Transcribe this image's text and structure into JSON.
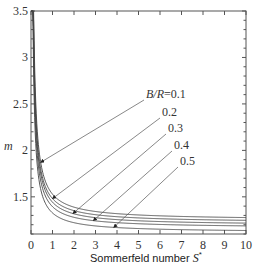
{
  "chart_data": {
    "type": "line",
    "title": "",
    "xlabel": "Sommerfeld number S*",
    "ylabel": "m",
    "xlim": [
      0,
      10
    ],
    "ylim": [
      1.1,
      3.5
    ],
    "xticks": [
      "0",
      "1",
      "2",
      "3",
      "4",
      "5",
      "6",
      "7",
      "8",
      "9",
      "10"
    ],
    "yticks": [
      "1.5",
      "2",
      "2.5",
      "3",
      "3.5"
    ],
    "grid": false,
    "legend_position": "inline annotations with arrows",
    "annotation_prefix": "B/R=",
    "x": [
      0.05,
      0.1,
      0.2,
      0.3,
      0.5,
      0.75,
      1,
      1.5,
      2,
      3,
      4,
      5,
      6,
      7,
      8,
      9,
      10
    ],
    "series": [
      {
        "name": "B/R=0.1",
        "label": "B/R=0.1",
        "values": [
          3.5,
          2.9,
          2.3,
          2.0,
          1.75,
          1.62,
          1.56,
          1.49,
          1.45,
          1.41,
          1.38,
          1.36,
          1.34,
          1.32,
          1.31,
          1.3,
          1.28
        ]
      },
      {
        "name": "B/R=0.2",
        "label": "0.2",
        "values": [
          3.4,
          2.75,
          2.18,
          1.92,
          1.68,
          1.57,
          1.51,
          1.45,
          1.42,
          1.38,
          1.35,
          1.33,
          1.31,
          1.29,
          1.28,
          1.27,
          1.25
        ]
      },
      {
        "name": "B/R=0.3",
        "label": "0.3",
        "values": [
          3.3,
          2.6,
          2.07,
          1.84,
          1.62,
          1.52,
          1.47,
          1.41,
          1.38,
          1.34,
          1.32,
          1.3,
          1.28,
          1.26,
          1.25,
          1.23,
          1.22
        ]
      },
      {
        "name": "B/R=0.4",
        "label": "0.4",
        "values": [
          3.2,
          2.45,
          1.96,
          1.76,
          1.56,
          1.47,
          1.42,
          1.37,
          1.34,
          1.3,
          1.28,
          1.26,
          1.24,
          1.22,
          1.21,
          1.2,
          1.19
        ]
      },
      {
        "name": "B/R=0.5",
        "label": "0.5",
        "values": [
          3.0,
          2.25,
          1.82,
          1.64,
          1.47,
          1.39,
          1.35,
          1.3,
          1.27,
          1.24,
          1.21,
          1.19,
          1.18,
          1.16,
          1.15,
          1.15,
          1.14
        ]
      }
    ],
    "annotations": [
      {
        "text": "B/R=0.1",
        "arrow_to_x": 0.45,
        "series": "B/R=0.1"
      },
      {
        "text": "0.2",
        "arrow_to_x": 1.0,
        "series": "B/R=0.2"
      },
      {
        "text": "0.3",
        "arrow_to_x": 1.95,
        "series": "B/R=0.3"
      },
      {
        "text": "0.4",
        "arrow_to_x": 2.9,
        "series": "B/R=0.4"
      },
      {
        "text": "0.5",
        "arrow_to_x": 3.85,
        "series": "B/R=0.5"
      }
    ]
  },
  "axis": {
    "x_title_main": "Sommerfeld number ",
    "x_title_symbol": "S",
    "x_title_sup": "*",
    "y_title": "m"
  }
}
